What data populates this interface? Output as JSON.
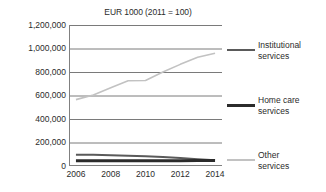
{
  "chart_data": {
    "type": "line",
    "title": "EUR 1000 (2011 = 100)",
    "xlabel": "",
    "ylabel": "",
    "x": [
      2006,
      2007,
      2008,
      2009,
      2010,
      2011,
      2012,
      2013,
      2014
    ],
    "xlim": [
      2005.6,
      2014.4
    ],
    "ylim": [
      0,
      1200000
    ],
    "xtick_labels": [
      "2006",
      "2008",
      "2010",
      "2012",
      "2014"
    ],
    "xtick_values": [
      2006,
      2008,
      2010,
      2012,
      2014
    ],
    "ytick_labels": [
      "0",
      "200,000",
      "400,000",
      "600,000",
      "800,000",
      "1,000,000",
      "1,200,000"
    ],
    "ytick_values": [
      0,
      200000,
      400000,
      600000,
      800000,
      1000000,
      1200000
    ],
    "grid": true,
    "grid_axis": "y",
    "legend_position": "right",
    "series": [
      {
        "name": "Institutional services",
        "label_line1": "Institutional",
        "label_line2": "services",
        "color": "#5a5a5a",
        "width": 2.0,
        "values": [
          95000,
          95000,
          92000,
          88000,
          83000,
          76000,
          68000,
          57000,
          48000
        ]
      },
      {
        "name": "Home care services",
        "label_line1": "Home care",
        "label_line2": "services",
        "color": "#2b2b2b",
        "width": 3.0,
        "values": [
          44000,
          44000,
          44000,
          44000,
          44000,
          45000,
          45000,
          46000,
          47000
        ]
      },
      {
        "name": "Other services",
        "label_line1": "Other",
        "label_line2": "services",
        "color": "#c2c2c2",
        "width": 1.6,
        "values": [
          565000,
          605000,
          665000,
          725000,
          728000,
          800000,
          865000,
          925000,
          960000
        ]
      }
    ]
  },
  "colors": {
    "axis": "#808080",
    "grid": "#7a7a7a",
    "text": "#2b2b2b",
    "background": "#ffffff"
  }
}
